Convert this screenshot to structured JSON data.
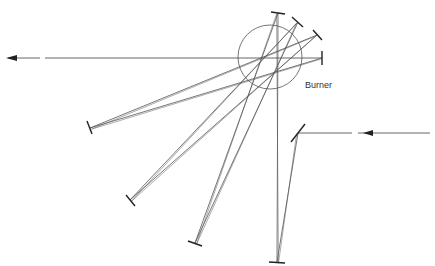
{
  "diagram": {
    "labels": {
      "burner": "Burner"
    },
    "colors": {
      "line": "#555555",
      "mirror": "#222222",
      "circle": "#666666"
    },
    "burner_circle": {
      "cx": 270,
      "cy": 57,
      "r": 32
    },
    "input_beam": {
      "from": [
        430,
        133
      ],
      "to": [
        298,
        133
      ],
      "label": "incoming beam"
    },
    "output_beam": {
      "from": [
        322,
        58
      ],
      "to": [
        8,
        58
      ],
      "label": "outgoing beam"
    },
    "mirrors": [
      {
        "id": "entry",
        "x1": 291,
        "y1": 142,
        "x2": 305,
        "y2": 124
      },
      {
        "id": "bottom-right",
        "x1": 269,
        "y1": 262,
        "x2": 285,
        "y2": 263
      },
      {
        "id": "top-1",
        "x1": 271,
        "y1": 12,
        "x2": 285,
        "y2": 14
      },
      {
        "id": "bottom-mid",
        "x1": 188,
        "y1": 241,
        "x2": 202,
        "y2": 246
      },
      {
        "id": "top-2",
        "x1": 292,
        "y1": 17,
        "x2": 303,
        "y2": 27
      },
      {
        "id": "bottom-left",
        "x1": 126,
        "y1": 195,
        "x2": 135,
        "y2": 206
      },
      {
        "id": "top-3",
        "x1": 313,
        "y1": 30,
        "x2": 322,
        "y2": 40
      },
      {
        "id": "left",
        "x1": 87,
        "y1": 121,
        "x2": 92,
        "y2": 134
      },
      {
        "id": "top-4",
        "x1": 322,
        "y1": 51,
        "x2": 322,
        "y2": 65
      }
    ],
    "beam_paths": [
      [
        [
          298,
          133
        ],
        [
          277,
          262
        ],
        [
          278,
          13
        ],
        [
          195,
          243
        ],
        [
          298,
          22
        ],
        [
          130,
          200
        ],
        [
          317,
          35
        ],
        [
          90,
          128
        ],
        [
          322,
          58
        ]
      ],
      [
        [
          298,
          133
        ],
        [
          277,
          262
        ]
      ],
      [
        [
          277,
          262
        ],
        [
          278,
          13
        ]
      ]
    ]
  }
}
